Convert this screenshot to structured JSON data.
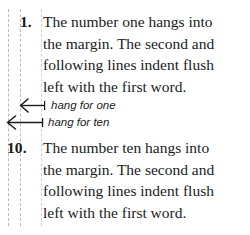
{
  "figure": {
    "background_color": "#ffffff",
    "text_color": "#1b1b1b",
    "guide_color": "#b9b9b9",
    "guide_text_color": "#cfcfcf",
    "width": 250,
    "height": 235
  },
  "guides": [
    {
      "name": "hang-for-ten-margin",
      "x": 8
    },
    {
      "name": "hang-for-one-margin",
      "x": 20
    },
    {
      "name": "text-flush-left-margin",
      "x": 41
    }
  ],
  "list_items": [
    {
      "number": "1.",
      "lines": [
        "The number one hangs into",
        "the margin. The second and",
        "following lines indent flush",
        "left with the first word."
      ]
    },
    {
      "number": "10.",
      "lines": [
        "The number ten hangs into",
        "the margin. The second and",
        "following lines indent flush",
        "left with the first word."
      ]
    }
  ],
  "annotations": [
    {
      "label": "hang for one",
      "arrow_from_x": 45,
      "arrow_to_x": 20
    },
    {
      "label": "hang for ten",
      "arrow_from_x": 43,
      "arrow_to_x": 7
    }
  ]
}
